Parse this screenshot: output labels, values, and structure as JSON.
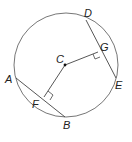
{
  "diagram": {
    "type": "circle-geometry",
    "circle": {
      "center": "C"
    },
    "points": {
      "A": "A",
      "B": "B",
      "C": "C",
      "D": "D",
      "E": "E",
      "F": "F",
      "G": "G"
    },
    "segments": [
      "AB",
      "DE",
      "CF",
      "CG"
    ],
    "right_angles": [
      "CFB",
      "CGE"
    ],
    "colors": {
      "stroke": "#555555",
      "text": "#222222"
    }
  }
}
